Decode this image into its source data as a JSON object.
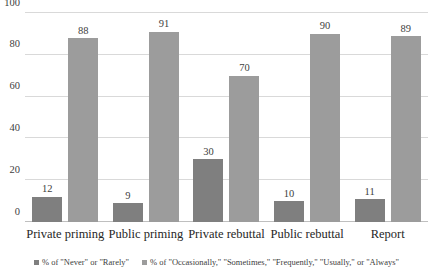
{
  "chart_data": {
    "type": "bar",
    "title": "",
    "subtitle": "",
    "xlabel": "",
    "ylabel": "",
    "ylim": [
      0,
      100
    ],
    "yticks": [
      0,
      20,
      40,
      60,
      80,
      100
    ],
    "grid": true,
    "legend_position": "bottom",
    "categories": [
      "Private priming",
      "Public priming",
      "Private rebuttal",
      "Public rebuttal",
      "Report"
    ],
    "series": [
      {
        "name": "% of \"Never\" or \"Rarely\"",
        "color": "#7f7f7f",
        "values": [
          12,
          9,
          30,
          10,
          11
        ]
      },
      {
        "name": "% of \"Occasionally,\" \"Sometimes,\" \"Frequently,\" \"Usually,\" or \"Always\"",
        "color": "#9c9c9c",
        "values": [
          88,
          91,
          70,
          90,
          89
        ]
      }
    ]
  }
}
